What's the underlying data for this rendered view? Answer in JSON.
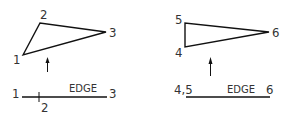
{
  "diagram": {
    "stroke_color": "#111111",
    "text_color": "#333333",
    "left": {
      "triangle_labels": {
        "v1": "1",
        "v2": "2",
        "v3": "3"
      },
      "edge_view": {
        "left_label": "1",
        "right_label": "3",
        "below_label": "2",
        "edge_label": "EDGE"
      }
    },
    "right": {
      "triangle_labels": {
        "v4": "4",
        "v5": "5",
        "v6": "6"
      },
      "edge_view": {
        "left_label": "4,5",
        "right_label": "6",
        "edge_label": "EDGE"
      }
    }
  }
}
